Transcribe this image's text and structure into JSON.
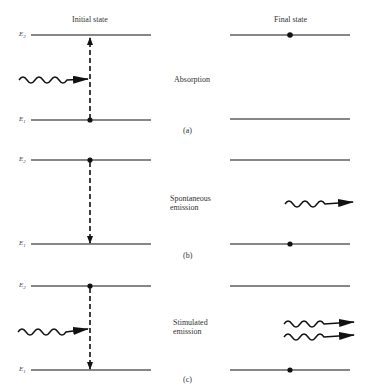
{
  "headers": {
    "initial": "Initial state",
    "final": "Final state"
  },
  "levels": {
    "upper": "E",
    "upper_sub": "2",
    "lower": "E",
    "lower_sub": "1"
  },
  "panels": [
    {
      "id": "a",
      "process_line1": "Absorption",
      "process_line2": "",
      "caption": "(a)",
      "initial": {
        "electron": "lower",
        "incoming_photons": 1,
        "transition": "up"
      },
      "final": {
        "electron": "upper",
        "outgoing_photons": 0
      }
    },
    {
      "id": "b",
      "process_line1": "Spontaneous",
      "process_line2": "emission",
      "caption": "(b)",
      "initial": {
        "electron": "upper",
        "incoming_photons": 0,
        "transition": "down"
      },
      "final": {
        "electron": "lower",
        "outgoing_photons": 1
      }
    },
    {
      "id": "c",
      "process_line1": "Stimulated",
      "process_line2": "emission",
      "caption": "(c)",
      "initial": {
        "electron": "upper",
        "incoming_photons": 1,
        "transition": "down"
      },
      "final": {
        "electron": "lower",
        "outgoing_photons": 2
      }
    }
  ],
  "colors": {
    "ink": "#111111",
    "background": "#ffffff"
  }
}
